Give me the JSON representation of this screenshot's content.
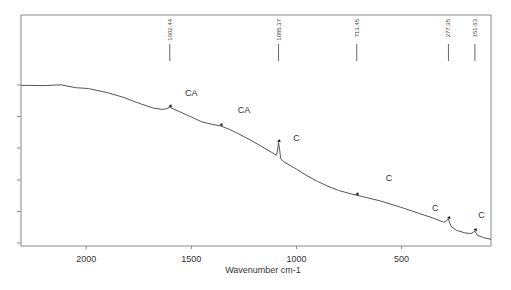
{
  "chart_data": {
    "type": "line",
    "title": "",
    "xlabel": "Wavenumber cm-1",
    "ylabel": "",
    "xlim": [
      2310,
      75
    ],
    "x_reversed": true,
    "xticks": [
      2000,
      1500,
      1000,
      500
    ],
    "xtick_labels": [
      "2000",
      "1500",
      "1000",
      "500"
    ],
    "yticks_count": 6,
    "ytick_labels": [],
    "grid": false,
    "legend": null,
    "series": [
      {
        "name": "spectrum",
        "color": "#555555",
        "x": [
          2310,
          2200,
          2120,
          2050,
          1990,
          1900,
          1820,
          1750,
          1680,
          1640,
          1620,
          1602.44,
          1560,
          1500,
          1450,
          1400,
          1360,
          1320,
          1280,
          1220,
          1160,
          1120,
          1095,
          1088,
          1085.37,
          1080,
          1075,
          1060,
          1000,
          950,
          900,
          850,
          800,
          760,
          713.45,
          680,
          600,
          500,
          420,
          350,
          300,
          290,
          277.35,
          265,
          240,
          200,
          170,
          151.63,
          140,
          110,
          75
        ],
        "y": [
          98.0,
          97.8,
          98.3,
          96.5,
          96.0,
          93.5,
          90.5,
          87.0,
          84.0,
          83.2,
          83.5,
          84.5,
          82.0,
          78.5,
          75.5,
          74.0,
          73.0,
          71.0,
          68.5,
          64.5,
          60.0,
          57.0,
          55.0,
          60.0,
          63.0,
          58.0,
          53.0,
          51.0,
          46.5,
          42.5,
          39.0,
          36.0,
          33.5,
          32.0,
          30.5,
          29.5,
          27.0,
          23.0,
          19.5,
          16.5,
          14.0,
          14.5,
          16.0,
          11.5,
          9.0,
          7.5,
          7.0,
          8.5,
          6.0,
          4.5,
          3.5
        ]
      }
    ],
    "peak_markers": [
      {
        "x": 1602.44,
        "label": "1602.44",
        "annotation": "CA"
      },
      {
        "x": 1360,
        "label": "",
        "annotation": "CA"
      },
      {
        "x": 1085.37,
        "label": "1085.37",
        "annotation": "C"
      },
      {
        "x": 713.45,
        "label": "713.45",
        "annotation": "C"
      },
      {
        "x": 277.35,
        "label": "277.35",
        "annotation": "C"
      },
      {
        "x": 151.63,
        "label": "151.63",
        "annotation": "C"
      }
    ],
    "annotations": [
      {
        "text": "CA",
        "x": 1500,
        "y_px": 96
      },
      {
        "text": "CA",
        "x": 1250,
        "y_px": 113
      },
      {
        "text": "C",
        "x": 1000,
        "y_px": 141
      },
      {
        "text": "C",
        "x": 560,
        "y_px": 181
      },
      {
        "text": "C",
        "x": 340,
        "y_px": 211
      },
      {
        "text": "C",
        "x": 120,
        "y_px": 218
      }
    ]
  }
}
